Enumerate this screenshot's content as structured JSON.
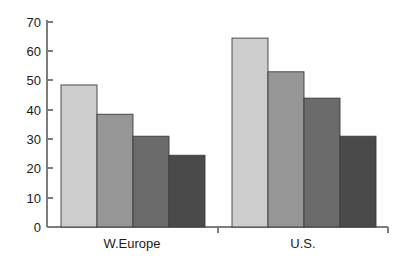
{
  "chart_data": {
    "type": "bar",
    "title": "",
    "xlabel": "",
    "ylabel": "",
    "categories": [
      "W.Europe",
      "U.S."
    ],
    "series": [
      {
        "name": "series-1",
        "color": "#cdcdcd",
        "values": [
          48.5,
          64.5
        ]
      },
      {
        "name": "series-2",
        "color": "#969696",
        "values": [
          38.5,
          53.0
        ]
      },
      {
        "name": "series-3",
        "color": "#6b6b6b",
        "values": [
          31.0,
          44.0
        ]
      },
      {
        "name": "series-4",
        "color": "#4a4a4a",
        "values": [
          24.5,
          31.0
        ]
      }
    ],
    "ylim": [
      0,
      70
    ],
    "ytick_labels": [
      "0",
      "10",
      "20",
      "30",
      "40",
      "50",
      "60",
      "70"
    ],
    "ytick_values": [
      0,
      10,
      20,
      30,
      40,
      50,
      60,
      70
    ],
    "grid": false,
    "legend": "none",
    "axis_color": "#7d7d7d",
    "bar_outline_color": "#3c3c3c",
    "text_color": "#1a1a1a",
    "background": "#ffffff"
  },
  "axis": {
    "y_ticks": [
      {
        "label": "70",
        "value": 70
      },
      {
        "label": "60",
        "value": 60
      },
      {
        "label": "50",
        "value": 50
      },
      {
        "label": "40",
        "value": 40
      },
      {
        "label": "30",
        "value": 30
      },
      {
        "label": "20",
        "value": 20
      },
      {
        "label": "10",
        "value": 10
      },
      {
        "label": "0",
        "value": 0
      }
    ],
    "x_categories": [
      {
        "label": "W.Europe"
      },
      {
        "label": "U.S."
      }
    ]
  }
}
